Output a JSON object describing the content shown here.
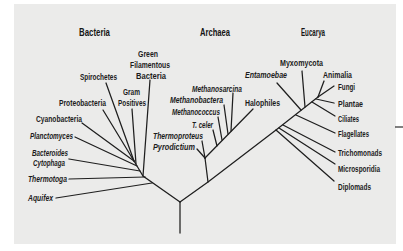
{
  "diagram": {
    "type": "phylogenetic-tree",
    "domains": {
      "bacteria": {
        "title": "Bacteria",
        "taxa": [
          {
            "lines": [
              "Green",
              "Filamentous",
              "Bacteria"
            ],
            "italic": false
          },
          {
            "lines": [
              "Spirochetes"
            ],
            "italic": false
          },
          {
            "lines": [
              "Gram",
              "Positives"
            ],
            "italic": false
          },
          {
            "lines": [
              "Proteobacteria"
            ],
            "italic": false
          },
          {
            "lines": [
              "Cyanobacteria"
            ],
            "italic": false
          },
          {
            "lines": [
              "Planctomyces"
            ],
            "italic": true
          },
          {
            "lines": [
              "Bacteroides",
              "Cytophaga"
            ],
            "italic": true
          },
          {
            "lines": [
              "Thermotoga"
            ],
            "italic": true
          },
          {
            "lines": [
              "Aquifex"
            ],
            "italic": true
          }
        ]
      },
      "archaea": {
        "title": "Archaea",
        "taxa": [
          {
            "lines": [
              "Methanosarcina"
            ],
            "italic": true
          },
          {
            "lines": [
              "Methanobactera"
            ],
            "italic": true
          },
          {
            "lines": [
              "Methanococcus"
            ],
            "italic": true
          },
          {
            "lines": [
              "T. celer"
            ],
            "italic": true
          },
          {
            "lines": [
              "Thermoproteus"
            ],
            "italic": true
          },
          {
            "lines": [
              "Pyrodictium"
            ],
            "italic": true
          },
          {
            "lines": [
              "Halophiles"
            ],
            "italic": false
          }
        ]
      },
      "eucarya": {
        "title": "Eucarya",
        "taxa": [
          {
            "lines": [
              "Entamoebae"
            ],
            "italic": true
          },
          {
            "lines": [
              "Myxomycota"
            ],
            "italic": false
          },
          {
            "lines": [
              "Animalia"
            ],
            "italic": false
          },
          {
            "lines": [
              "Fungi"
            ],
            "italic": false
          },
          {
            "lines": [
              "Plantae"
            ],
            "italic": false
          },
          {
            "lines": [
              "Ciliates"
            ],
            "italic": false
          },
          {
            "lines": [
              "Flagellates"
            ],
            "italic": false
          },
          {
            "lines": [
              "Trichomonads"
            ],
            "italic": false
          },
          {
            "lines": [
              "Microsporidia"
            ],
            "italic": false
          },
          {
            "lines": [
              "Diplomads"
            ],
            "italic": false
          }
        ]
      }
    },
    "colors": {
      "panel_background": "#ebebea",
      "line_color": "#1e1e1e",
      "text_color": "#1c1c1c"
    }
  }
}
